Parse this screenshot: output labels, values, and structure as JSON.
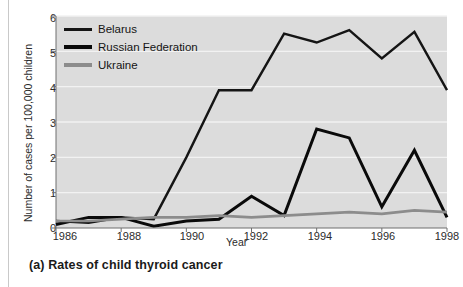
{
  "figure": {
    "caption": "(a) Rates of child thyroid cancer"
  },
  "chart_data": {
    "type": "line",
    "title": "",
    "subtitle": "",
    "xlabel": "Year",
    "ylabel": "Number of cases per 100,000 children",
    "x": [
      1986,
      1987,
      1988,
      1989,
      1990,
      1991,
      1992,
      1993,
      1994,
      1995,
      1996,
      1997,
      1998
    ],
    "xlim": [
      1986,
      1998
    ],
    "ylim": [
      0,
      6
    ],
    "xticks": [
      1986,
      1988,
      1990,
      1992,
      1994,
      1996,
      1998
    ],
    "xtick_labels": [
      "1986",
      "1988",
      "1990",
      "1992",
      "1994",
      "1996",
      "1998"
    ],
    "yticks": [
      0,
      1,
      2,
      3,
      4,
      5,
      6
    ],
    "ytick_labels": [
      "0",
      "1",
      "2",
      "3",
      "4",
      "5",
      "6"
    ],
    "grid": "horizontal",
    "legend_position": "top-left",
    "plot_background": "#dcdcdc",
    "series": [
      {
        "name": "Belarus",
        "color": "#151515",
        "width": 2.4,
        "values": [
          0.2,
          0.15,
          0.3,
          0.25,
          2.0,
          3.9,
          3.9,
          5.5,
          5.25,
          5.6,
          4.8,
          5.55,
          3.9
        ]
      },
      {
        "name": "Russian Federation",
        "color": "#0a0a0a",
        "width": 3.0,
        "values": [
          0.1,
          0.3,
          0.3,
          0.05,
          0.2,
          0.25,
          0.9,
          0.35,
          2.8,
          2.55,
          0.6,
          2.2,
          0.3
        ]
      },
      {
        "name": "Ukraine",
        "color": "#8c8c8c",
        "width": 2.6,
        "values": [
          0.2,
          0.2,
          0.25,
          0.3,
          0.3,
          0.35,
          0.3,
          0.35,
          0.4,
          0.45,
          0.4,
          0.5,
          0.45
        ]
      }
    ]
  }
}
